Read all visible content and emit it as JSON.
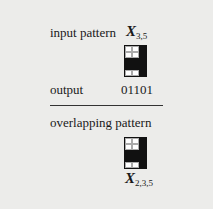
{
  "figure": {
    "input": {
      "label": "input pattern",
      "var_base": "X",
      "var_sub": "3,5",
      "grid": [
        [
          0,
          0,
          1
        ],
        [
          0,
          0,
          1
        ],
        [
          1,
          1,
          1
        ],
        [
          1,
          1,
          1
        ],
        [
          0,
          0,
          1
        ]
      ]
    },
    "output": {
      "label": "output",
      "value": "01101"
    },
    "overlap": {
      "label": "overlapping pattern",
      "var_base": "X",
      "var_sub": "2,3,5",
      "grid": [
        [
          0,
          0,
          1
        ],
        [
          0,
          0,
          1
        ],
        [
          1,
          1,
          1
        ],
        [
          1,
          1,
          1
        ],
        [
          0,
          0,
          1
        ]
      ]
    }
  }
}
